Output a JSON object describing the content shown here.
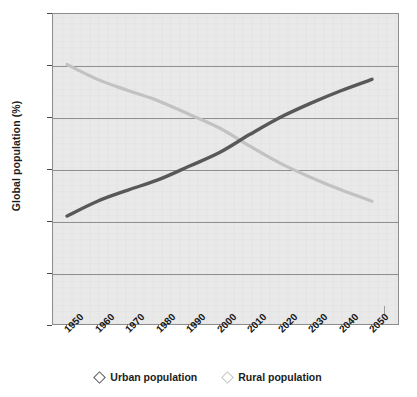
{
  "chart_data": {
    "type": "line",
    "title": "",
    "xlabel": "",
    "ylabel": "Global population (%)",
    "xlim": [
      1950,
      2050
    ],
    "ylim": [
      0,
      84
    ],
    "yticks": [
      0,
      14,
      28,
      42,
      56,
      70,
      84
    ],
    "xticks": [
      1950,
      1960,
      1970,
      1980,
      1990,
      2000,
      2010,
      2020,
      2030,
      2040,
      2050
    ],
    "grid": true,
    "legend_position": "bottom",
    "x": [
      1950,
      1960,
      1970,
      1980,
      1990,
      2000,
      2010,
      2020,
      2030,
      2040,
      2050
    ],
    "series": [
      {
        "name": "Urban population",
        "color": "#585858",
        "marker": "diamond",
        "values": [
          29.6,
          33.6,
          36.6,
          39.4,
          43.0,
          46.7,
          51.6,
          56.2,
          60.0,
          63.4,
          66.4
        ]
      },
      {
        "name": "Rural population",
        "color": "#c2c2c2",
        "marker": "diamond",
        "values": [
          70.4,
          66.4,
          63.4,
          60.6,
          57.0,
          53.3,
          48.4,
          43.8,
          40.0,
          36.6,
          33.6
        ]
      }
    ],
    "annotations": [
      "Urban and rural curves cross near 2007 at about 50%"
    ]
  },
  "axis": {
    "y_title": "Global population (%)",
    "y_tick_labels": [
      "84",
      "70",
      "56",
      "42",
      "28",
      "14",
      "0"
    ],
    "x_tick_labels": [
      "1950",
      "1960",
      "1970",
      "1980",
      "1990",
      "2000",
      "2010",
      "2020",
      "2030",
      "2040",
      "2050"
    ]
  },
  "legend": {
    "items": [
      {
        "label": "Urban population",
        "marker": "diamond-marker-urban"
      },
      {
        "label": "Rural population",
        "marker": "diamond-marker-rural"
      }
    ]
  },
  "colors": {
    "urban_line": "#585858",
    "rural_line": "#c2c2c2",
    "plot_background": "#e9e9e9",
    "gridline": "#8f8f8f",
    "frame": "#8d8d8d",
    "text": "#161616"
  }
}
